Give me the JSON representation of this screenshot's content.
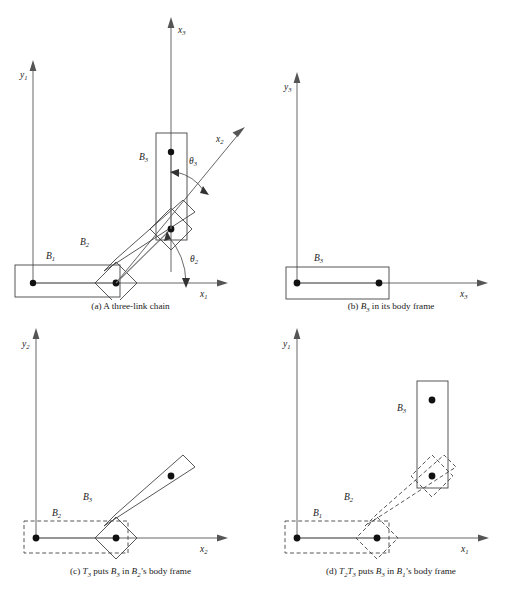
{
  "figure": {
    "type": "technical-line-diagram",
    "background_color": "#ffffff",
    "line_color": "#444444",
    "axis_color": "#555555",
    "panel_count": 4
  },
  "panels": [
    {
      "id": "a",
      "caption_prefix": "(a)",
      "caption_text": "A three-link chain",
      "axes": [
        {
          "name": "y1",
          "label_base": "y",
          "label_sub": "1",
          "direction": "up"
        },
        {
          "name": "x1",
          "label_base": "x",
          "label_sub": "1",
          "direction": "right"
        },
        {
          "name": "x3",
          "label_base": "x",
          "label_sub": "3",
          "direction": "up"
        },
        {
          "name": "x2",
          "label_base": "x",
          "label_sub": "2",
          "direction": "up-right-45"
        }
      ],
      "bodies": [
        {
          "name": "B1",
          "label_base": "B",
          "label_sub": "1",
          "style": "solid",
          "orientation": "horizontal"
        },
        {
          "name": "B2",
          "label_base": "B",
          "label_sub": "2",
          "style": "solid",
          "orientation": "diagonal-45"
        },
        {
          "name": "B3",
          "label_base": "B",
          "label_sub": "3",
          "style": "solid",
          "orientation": "vertical"
        }
      ],
      "angles": [
        {
          "name": "theta2",
          "label_base": "θ",
          "label_sub": "2"
        },
        {
          "name": "theta3",
          "label_base": "θ",
          "label_sub": "3"
        }
      ]
    },
    {
      "id": "b",
      "caption_prefix": "(b)",
      "caption_text": "in its body frame",
      "caption_body_base": "B",
      "caption_body_sub": "3",
      "axes": [
        {
          "name": "y3",
          "label_base": "y",
          "label_sub": "3",
          "direction": "up"
        },
        {
          "name": "x3",
          "label_base": "x",
          "label_sub": "3",
          "direction": "right"
        }
      ],
      "bodies": [
        {
          "name": "B3",
          "label_base": "B",
          "label_sub": "3",
          "style": "solid",
          "orientation": "horizontal"
        }
      ],
      "angles": []
    },
    {
      "id": "c",
      "caption_prefix": "(c)",
      "caption_text": "puts",
      "caption_full": "T3 puts B3 in B2's body frame",
      "axes": [
        {
          "name": "y2",
          "label_base": "y",
          "label_sub": "2",
          "direction": "up"
        },
        {
          "name": "x2",
          "label_base": "x",
          "label_sub": "2",
          "direction": "right"
        }
      ],
      "bodies": [
        {
          "name": "B2",
          "label_base": "B",
          "label_sub": "2",
          "style": "dashed",
          "orientation": "horizontal"
        },
        {
          "name": "B3",
          "label_base": "B",
          "label_sub": "3",
          "style": "solid",
          "orientation": "diagonal-45"
        }
      ],
      "angles": []
    },
    {
      "id": "d",
      "caption_prefix": "(d)",
      "caption_full": "T2T3 puts B3 in B1's body frame",
      "axes": [
        {
          "name": "y1",
          "label_base": "y",
          "label_sub": "1",
          "direction": "up"
        },
        {
          "name": "x1",
          "label_base": "x",
          "label_sub": "1",
          "direction": "right"
        }
      ],
      "bodies": [
        {
          "name": "B1",
          "label_base": "B",
          "label_sub": "1",
          "style": "dashed",
          "orientation": "horizontal"
        },
        {
          "name": "B2",
          "label_base": "B",
          "label_sub": "2",
          "style": "dashed",
          "orientation": "diagonal-45"
        },
        {
          "name": "B3",
          "label_base": "B",
          "label_sub": "3",
          "style": "solid",
          "orientation": "vertical"
        }
      ],
      "angles": []
    }
  ],
  "labels": {
    "x": "x",
    "y": "y",
    "B": "B",
    "T": "T",
    "theta": "θ",
    "sub1": "1",
    "sub2": "2",
    "sub3": "3"
  },
  "captions": {
    "a": "(a) A three-link chain",
    "b_prefix": "(b) ",
    "b_body": "B",
    "b_body_sub": "3",
    "b_rest": " in its body frame",
    "c_prefix": "(c) ",
    "c_t": "T",
    "c_t_sub": "3",
    "c_mid": " puts ",
    "c_b3": "B",
    "c_b3_sub": "3",
    "c_in": " in ",
    "c_b2": "B",
    "c_b2_sub": "2",
    "c_rest": "’s body frame",
    "d_prefix": "(d) ",
    "d_t2": "T",
    "d_t2_sub": "2",
    "d_t3": "T",
    "d_t3_sub": "3",
    "d_mid": " puts ",
    "d_b3": "B",
    "d_b3_sub": "3",
    "d_in": " in ",
    "d_b1": "B",
    "d_b1_sub": "1",
    "d_rest": "’s body frame"
  }
}
